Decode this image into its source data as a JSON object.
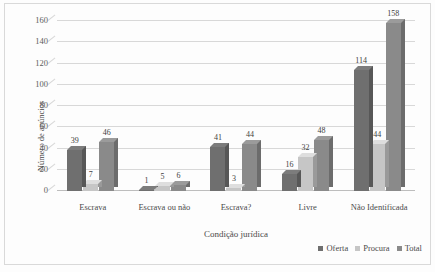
{
  "chart_data": {
    "type": "bar",
    "title": "",
    "xlabel": "Condição jurídica",
    "ylabel": "Número de anúncios",
    "ylim": [
      0,
      160
    ],
    "ytick_step": 20,
    "yticks": [
      0,
      20,
      40,
      60,
      80,
      100,
      120,
      140,
      160
    ],
    "grid": true,
    "grid_axis": "y",
    "legend_position": "bottom-right",
    "categories": [
      "Escrava",
      "Escrava ou não",
      "Escrava?",
      "Livre",
      "Não Identificada"
    ],
    "series": [
      {
        "name": "Oferta",
        "color": "#6f6f6f",
        "values": [
          39,
          1,
          41,
          16,
          114
        ]
      },
      {
        "name": "Procura",
        "color": "#c6c6c6",
        "values": [
          7,
          5,
          3,
          32,
          44
        ]
      },
      {
        "name": "Total",
        "color": "#8a8a8a",
        "values": [
          46,
          6,
          44,
          48,
          158
        ]
      }
    ],
    "data_labels": [
      {
        "category": "Escrava",
        "Oferta": 39,
        "Procura": 7,
        "Total": 46
      },
      {
        "category": "Escrava ou não",
        "Oferta": 1,
        "Procura": 5,
        "Total": 6
      },
      {
        "category": "Escrava?",
        "Oferta": 41,
        "Procura": 3,
        "Total": 44
      },
      {
        "category": "Livre",
        "Oferta": 16,
        "Procura": 32,
        "Total": 48
      },
      {
        "category": "Não Identificada",
        "Oferta": 114,
        "Procura": 44,
        "Total": 158
      }
    ],
    "style": {
      "effect": "3d-extruded-columns",
      "background": "#fdfdfd",
      "frame_border": "#d9d9d9",
      "gridline_color": "#d8d8d8",
      "text_color": "#4a4a4a"
    }
  }
}
